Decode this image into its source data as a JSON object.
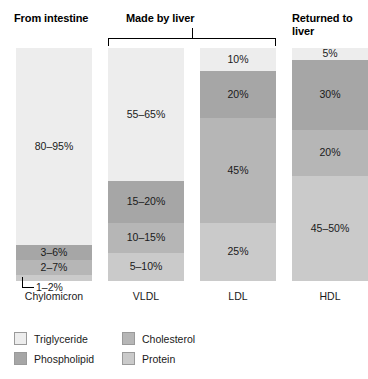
{
  "headers": {
    "intestine": "From intestine",
    "liver": "Made by liver",
    "returned": "Returned to liver"
  },
  "callout": {
    "chylomicron_protein": "1–2%"
  },
  "legend": {
    "items": [
      {
        "label": "Triglyceride",
        "color": "#ededed"
      },
      {
        "label": "Phospholipid",
        "color": "#a6a6a6"
      },
      {
        "label": "Cholesterol",
        "color": "#b6b6b6"
      },
      {
        "label": "Protein",
        "color": "#cacaca"
      }
    ]
  },
  "chart_data": {
    "type": "bar",
    "subtitle": "",
    "xlabel": "",
    "ylabel": "",
    "ylim": [
      0,
      100
    ],
    "grid": false,
    "stacked": true,
    "legend_position": "bottom-left",
    "categories": [
      "Chylomicron",
      "VLDL",
      "LDL",
      "HDL"
    ],
    "series": [
      {
        "name": "Triglyceride",
        "color": "#ededed",
        "labels": [
          "80–95%",
          "55–65%",
          "10%",
          "5%"
        ],
        "values": [
          87.5,
          60,
          10,
          5
        ]
      },
      {
        "name": "Phospholipid",
        "color": "#a6a6a6",
        "labels": [
          "3–6%",
          "15–20%",
          "20%",
          "30%"
        ],
        "values": [
          4.5,
          17.5,
          20,
          30
        ]
      },
      {
        "name": "Cholesterol",
        "color": "#b6b6b6",
        "labels": [
          "2–7%",
          "10–15%",
          "45%",
          "20%"
        ],
        "values": [
          4.5,
          12.5,
          45,
          20
        ]
      },
      {
        "name": "Protein",
        "color": "#cacaca",
        "labels": [
          "1–2%",
          "5–10%",
          "25%",
          "45–50%"
        ],
        "values": [
          1.5,
          10,
          25,
          47.5
        ]
      }
    ],
    "bars": [
      {
        "category": "Chylomicron",
        "segments": [
          {
            "name": "Triglyceride",
            "label": "80–95%",
            "pct": 84.5,
            "color": "#ededed",
            "label_visible": true
          },
          {
            "name": "Phospholipid",
            "label": "3–6%",
            "pct": 6.5,
            "color": "#a6a6a6",
            "label_visible": true
          },
          {
            "name": "Cholesterol",
            "label": "2–7%",
            "pct": 6.5,
            "color": "#b6b6b6",
            "label_visible": true
          },
          {
            "name": "Protein",
            "label": "1–2%",
            "pct": 2.5,
            "color": "#cacaca",
            "label_visible": false
          }
        ]
      },
      {
        "category": "VLDL",
        "segments": [
          {
            "name": "Triglyceride",
            "label": "55–65%",
            "pct": 57,
            "color": "#ededed",
            "label_visible": true
          },
          {
            "name": "Phospholipid",
            "label": "15–20%",
            "pct": 18,
            "color": "#a6a6a6",
            "label_visible": true
          },
          {
            "name": "Cholesterol",
            "label": "10–15%",
            "pct": 13,
            "color": "#b6b6b6",
            "label_visible": true
          },
          {
            "name": "Protein",
            "label": "5–10%",
            "pct": 12,
            "color": "#cacaca",
            "label_visible": true
          }
        ]
      },
      {
        "category": "LDL",
        "segments": [
          {
            "name": "Triglyceride",
            "label": "10%",
            "pct": 10,
            "color": "#ededed",
            "label_visible": true
          },
          {
            "name": "Phospholipid",
            "label": "20%",
            "pct": 20,
            "color": "#a6a6a6",
            "label_visible": true
          },
          {
            "name": "Cholesterol",
            "label": "45%",
            "pct": 45,
            "color": "#b6b6b6",
            "label_visible": true
          },
          {
            "name": "Protein",
            "label": "25%",
            "pct": 25,
            "color": "#cacaca",
            "label_visible": true
          }
        ]
      },
      {
        "category": "HDL",
        "segments": [
          {
            "name": "Triglyceride",
            "label": "5%",
            "pct": 5,
            "color": "#ededed",
            "label_visible": true
          },
          {
            "name": "Phospholipid",
            "label": "30%",
            "pct": 30,
            "color": "#a6a6a6",
            "label_visible": true
          },
          {
            "name": "Cholesterol",
            "label": "20%",
            "pct": 20,
            "color": "#b6b6b6",
            "label_visible": true
          },
          {
            "name": "Protein",
            "label": "45–50%",
            "pct": 45,
            "color": "#cacaca",
            "label_visible": true
          }
        ]
      }
    ]
  }
}
